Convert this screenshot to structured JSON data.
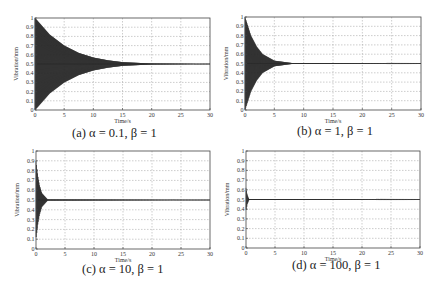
{
  "figure": {
    "y_label": "Vibration/mm",
    "x_label": "Time/s",
    "x_ticks": [
      "0",
      "5",
      "10",
      "15",
      "20",
      "25",
      "30"
    ],
    "y_ticks": [
      "0",
      "0.1",
      "0.2",
      "0.3",
      "0.4",
      "0.5",
      "0.6",
      "0.7",
      "0.8",
      "0.9",
      "1"
    ],
    "colors": {
      "signal": "#2a2a2a",
      "grid": "#9a9a9a",
      "axis": "#444444"
    }
  },
  "panels": [
    {
      "id": "a",
      "caption_letter": "(a)",
      "caption_params": "α = 0.1, β = 1",
      "alpha": 0.1,
      "beta": 1,
      "settle_time_s": 20,
      "box": [
        35,
        18,
        210,
        110
      ]
    },
    {
      "id": "b",
      "caption_letter": "(b)",
      "caption_params": "α = 1, β = 1",
      "alpha": 1,
      "beta": 1,
      "settle_time_s": 8,
      "box": [
        245,
        17,
        421,
        110
      ]
    },
    {
      "id": "c",
      "caption_letter": "(c)",
      "caption_params": "α = 10, β = 1",
      "alpha": 10,
      "beta": 1,
      "settle_time_s": 2,
      "box": [
        36,
        151,
        210,
        249
      ]
    },
    {
      "id": "d",
      "caption_letter": "(d)",
      "caption_params": "α = 100, β = 1",
      "alpha": 100,
      "beta": 1,
      "settle_time_s": 0.5,
      "box": [
        246,
        151,
        420,
        248
      ]
    }
  ],
  "chart_data": [
    {
      "type": "line",
      "title": "(a) α = 0.1, β = 1",
      "xlabel": "Time/s",
      "ylabel": "Vibration/mm",
      "xlim": [
        0,
        30
      ],
      "ylim": [
        0,
        1
      ],
      "grid": true,
      "x_ticks": [
        0,
        5,
        10,
        15,
        20,
        25,
        30
      ],
      "y_ticks": [
        0,
        0.1,
        0.2,
        0.3,
        0.4,
        0.5,
        0.6,
        0.7,
        0.8,
        0.9,
        1
      ],
      "series": [
        {
          "name": "vibration",
          "description": "high-frequency oscillation around 0.5 with envelope decaying from ±0.5 to ~0 by ~20 s",
          "envelope_upper": {
            "x": [
              0,
              2.5,
              5,
              7.5,
              10,
              12.5,
              15,
              20,
              30
            ],
            "y": [
              1.0,
              0.82,
              0.7,
              0.62,
              0.57,
              0.54,
              0.52,
              0.505,
              0.5
            ]
          },
          "envelope_lower": {
            "x": [
              0,
              2.5,
              5,
              7.5,
              10,
              12.5,
              15,
              20,
              30
            ],
            "y": [
              0.0,
              0.18,
              0.3,
              0.38,
              0.43,
              0.46,
              0.48,
              0.495,
              0.5
            ]
          },
          "steady_value": 0.5
        }
      ]
    },
    {
      "type": "line",
      "title": "(b) α = 1, β = 1",
      "xlabel": "Time/s",
      "ylabel": "Vibration/mm",
      "xlim": [
        0,
        30
      ],
      "ylim": [
        0,
        1
      ],
      "grid": true,
      "x_ticks": [
        0,
        5,
        10,
        15,
        20,
        25,
        30
      ],
      "y_ticks": [
        0,
        0.1,
        0.2,
        0.3,
        0.4,
        0.5,
        0.6,
        0.7,
        0.8,
        0.9,
        1
      ],
      "series": [
        {
          "name": "vibration",
          "description": "oscillation around 0.5, envelope decays to ~0 by ~8 s",
          "envelope_upper": {
            "x": [
              0,
              1,
              2,
              3,
              5,
              8,
              30
            ],
            "y": [
              1.0,
              0.8,
              0.68,
              0.6,
              0.53,
              0.505,
              0.5
            ]
          },
          "envelope_lower": {
            "x": [
              0,
              1,
              2,
              3,
              5,
              8,
              30
            ],
            "y": [
              0.0,
              0.2,
              0.32,
              0.4,
              0.47,
              0.495,
              0.5
            ]
          },
          "steady_value": 0.5
        }
      ]
    },
    {
      "type": "line",
      "title": "(c) α = 10, β = 1",
      "xlabel": "Time/s",
      "ylabel": "Vibration/mm",
      "xlim": [
        0,
        30
      ],
      "ylim": [
        0,
        1
      ],
      "grid": true,
      "x_ticks": [
        0,
        5,
        10,
        15,
        20,
        25,
        30
      ],
      "y_ticks": [
        0,
        0.1,
        0.2,
        0.3,
        0.4,
        0.5,
        0.6,
        0.7,
        0.8,
        0.9,
        1
      ],
      "series": [
        {
          "name": "vibration",
          "description": "oscillation around 0.5, envelope decays to ~0 by ~2 s",
          "envelope_upper": {
            "x": [
              0,
              0.3,
              0.6,
              1,
              2,
              30
            ],
            "y": [
              0.9,
              0.75,
              0.65,
              0.57,
              0.505,
              0.5
            ]
          },
          "envelope_lower": {
            "x": [
              0,
              0.3,
              0.6,
              1,
              2,
              30
            ],
            "y": [
              0.1,
              0.25,
              0.35,
              0.43,
              0.495,
              0.5
            ]
          },
          "steady_value": 0.5
        }
      ]
    },
    {
      "type": "line",
      "title": "(d) α = 100, β = 1",
      "xlabel": "Time/s",
      "ylabel": "Vibration/mm",
      "xlim": [
        0,
        30
      ],
      "ylim": [
        0,
        1
      ],
      "grid": true,
      "x_ticks": [
        0,
        5,
        10,
        15,
        20,
        25,
        30
      ],
      "y_ticks": [
        0,
        0.1,
        0.2,
        0.3,
        0.4,
        0.5,
        0.6,
        0.7,
        0.8,
        0.9,
        1
      ],
      "series": [
        {
          "name": "vibration",
          "description": "brief small oscillation near t=0 (peak ~0.6/~0.4), settles at 0.5 by ~0.5 s",
          "envelope_upper": {
            "x": [
              0,
              0.2,
              0.5,
              30
            ],
            "y": [
              0.62,
              0.55,
              0.505,
              0.5
            ]
          },
          "envelope_lower": {
            "x": [
              0,
              0.2,
              0.5,
              30
            ],
            "y": [
              0.38,
              0.45,
              0.495,
              0.5
            ]
          },
          "steady_value": 0.5
        }
      ]
    }
  ]
}
